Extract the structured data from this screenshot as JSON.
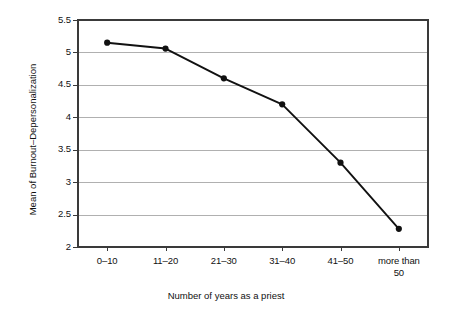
{
  "chart_data": {
    "type": "line",
    "title": "",
    "subtitle": "",
    "xlabel": "Number of years as a priest",
    "ylabel": "Mean of Burnout–Depersonalization",
    "categories": [
      "0–10",
      "11–20",
      "21–30",
      "31–40",
      "41–50",
      "more than 50"
    ],
    "values": [
      5.15,
      5.06,
      4.6,
      4.2,
      3.3,
      2.28
    ],
    "series": [
      {
        "name": "Mean of Burnout–Depersonalization",
        "values": [
          5.15,
          5.06,
          4.6,
          4.2,
          3.3,
          2.28
        ]
      }
    ],
    "ylim": [
      2,
      5.5
    ],
    "ytick_labels": [
      "2",
      "2.5",
      "3",
      "3.5",
      "4",
      "4.5",
      "5",
      "5.5"
    ],
    "ytick_values": [
      2,
      2.5,
      3,
      3.5,
      4,
      4.5,
      5,
      5.5
    ],
    "grid": "horizontal",
    "gridlines_at": [
      2.5,
      3,
      3.5,
      4,
      4.5,
      5
    ],
    "legend": "none",
    "marker": "filled-circle",
    "line_color": "#111111",
    "marker_color": "#111111",
    "grid_color": "#b0b0b0",
    "axis_color": "#3a3a3a",
    "background_color": "#ffffff"
  },
  "axes": {
    "x_tick_labels": [
      {
        "line1": "0–10",
        "line2": ""
      },
      {
        "line1": "11–20",
        "line2": ""
      },
      {
        "line1": "21–30",
        "line2": ""
      },
      {
        "line1": "31–40",
        "line2": ""
      },
      {
        "line1": "41–50",
        "line2": ""
      },
      {
        "line1": "more than",
        "line2": "50"
      }
    ],
    "y_tick_labels": [
      "5.5",
      "5",
      "4.5",
      "4",
      "3.5",
      "3",
      "2.5",
      "2"
    ]
  }
}
